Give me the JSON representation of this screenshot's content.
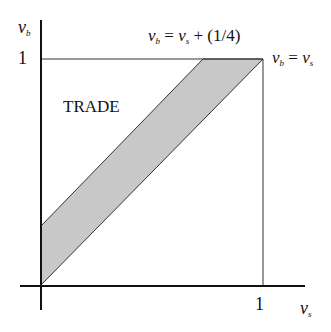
{
  "diagram": {
    "y_axis_label": {
      "var": "v",
      "sub": "b"
    },
    "x_axis_label": {
      "var": "v",
      "sub": "s"
    },
    "y_tick": "1",
    "x_tick": "1",
    "region_label": "TRADE",
    "line_upper": {
      "lhs_var": "v",
      "lhs_sub": "b",
      "rhs_var": "v",
      "rhs_sub": "s",
      "rhs_extra": " + (1/4)"
    },
    "line_lower": {
      "lhs_var": "v",
      "lhs_sub": "b",
      "rhs_var": "v",
      "rhs_sub": "s"
    },
    "band_offset": 0.25,
    "colors": {
      "band_fill": "#c8c8c8",
      "lines": "#222222"
    }
  }
}
